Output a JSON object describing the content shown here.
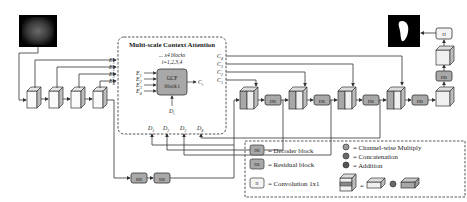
{
  "mca": {
    "title": "Multi-scale Context Attention",
    "blocks_note": "... x4 blocks",
    "index_note": "i=1,2,3,4",
    "gcf_line1": "GCF",
    "gcf_line2": "block i",
    "output_label": "C",
    "output_sub": "i",
    "input_label": "D",
    "input_sub": "i"
  },
  "e_labels": [
    {
      "base": "E",
      "sub": "1"
    },
    {
      "base": "E",
      "sub": "2"
    },
    {
      "base": "E",
      "sub": "3"
    },
    {
      "base": "E",
      "sub": "4"
    }
  ],
  "c_labels": [
    {
      "base": "C",
      "sub": "4"
    },
    {
      "base": "C",
      "sub": "3"
    },
    {
      "base": "C",
      "sub": "2"
    },
    {
      "base": "C",
      "sub": "1"
    }
  ],
  "d_labels": [
    {
      "base": "D",
      "sub": "1"
    },
    {
      "base": "D",
      "sub": "2"
    },
    {
      "base": "D",
      "sub": "3"
    },
    {
      "base": "D",
      "sub": "4"
    }
  ],
  "blocks": {
    "db": "DB",
    "rb": "RB",
    "h": "H"
  },
  "legend": {
    "db_label": "= Decoder block",
    "rb_label": "= Residual block",
    "h_label": "= Convolution 1x1",
    "multiply_label": "= Channel-wise Multiply",
    "concat_label": "= Concatenation",
    "add_label": "= Addition",
    "equals": "="
  },
  "colors": {
    "block_fill": "#a8a8a8",
    "cube_face": "#f4f4f4",
    "cube_side": "#bdbdbd",
    "line": "#333333",
    "dashed": "#444444"
  }
}
